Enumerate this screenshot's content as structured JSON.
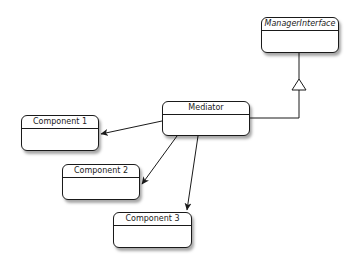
{
  "diagram": {
    "type": "uml-class-diagram",
    "classes": [
      {
        "id": "manager_interface",
        "name": "ManagerInterface",
        "italic": true
      },
      {
        "id": "mediator",
        "name": "Mediator",
        "italic": false
      },
      {
        "id": "component1",
        "name": "Component 1",
        "italic": false
      },
      {
        "id": "component2",
        "name": "Component 2",
        "italic": false
      },
      {
        "id": "component3",
        "name": "Component 3",
        "italic": false
      }
    ],
    "relations": [
      {
        "from": "mediator",
        "to": "manager_interface",
        "kind": "realization-triangle"
      },
      {
        "from": "mediator",
        "to": "component1",
        "kind": "directed-association"
      },
      {
        "from": "mediator",
        "to": "component2",
        "kind": "directed-association"
      },
      {
        "from": "mediator",
        "to": "component3",
        "kind": "directed-association"
      }
    ]
  }
}
